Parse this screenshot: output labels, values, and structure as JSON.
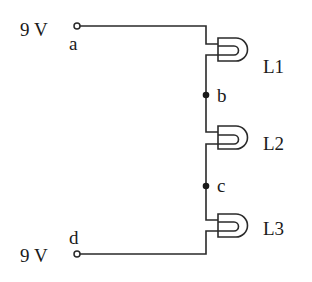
{
  "diagram": {
    "type": "series-circuit",
    "terminals": [
      {
        "id": "a",
        "voltage_label": "9 V",
        "node_label": "a"
      },
      {
        "id": "d",
        "voltage_label": "9 V",
        "node_label": "d"
      }
    ],
    "nodes": [
      {
        "id": "b",
        "label": "b"
      },
      {
        "id": "c",
        "label": "c"
      }
    ],
    "lamps": [
      {
        "id": "L1",
        "label": "L1"
      },
      {
        "id": "L2",
        "label": "L2"
      },
      {
        "id": "L3",
        "label": "L3"
      }
    ],
    "connections": [
      "a-L1",
      "L1-b",
      "b-L2",
      "L2-c",
      "c-L3",
      "L3-d"
    ],
    "colors": {
      "line": "#2a2a2a",
      "text": "#1a1a1a",
      "background": "#ffffff"
    }
  }
}
